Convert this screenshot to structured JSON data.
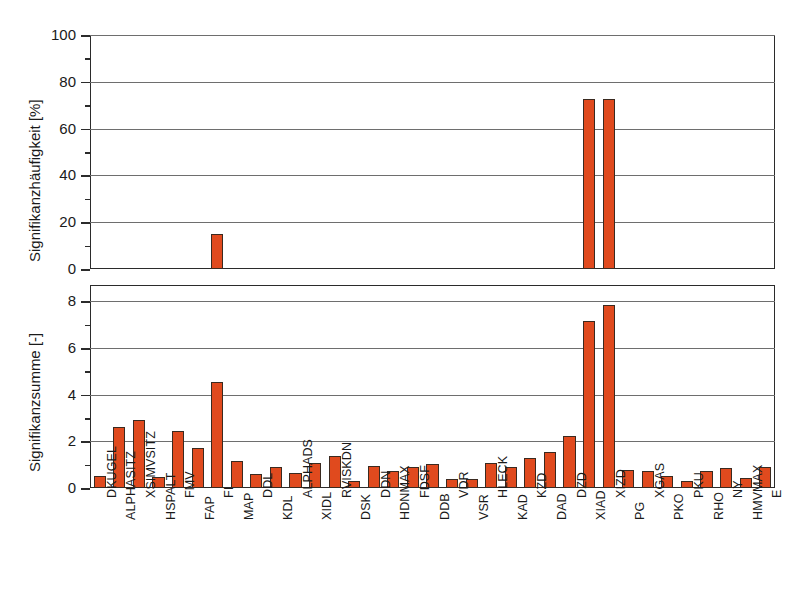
{
  "chart_data": {
    "type": "bar",
    "title": "",
    "xlabel": "",
    "grid": true,
    "legend": "none",
    "categories": [
      "DKUGEL",
      "ALPHASITZ",
      "XSIMVSITZ",
      "HSPALT",
      "FMV",
      "FAP",
      "FI",
      "MAP",
      "DDL",
      "KDL",
      "ALPHADS",
      "XIDL",
      "RVISKDN",
      "DSK",
      "DDN",
      "HDNMAX",
      "FDSF",
      "DDB",
      "VDR",
      "VSR",
      "HLECK",
      "KAD",
      "KZD",
      "DAD",
      "DZD",
      "XIAD",
      "XIZD",
      "PG",
      "XGAS",
      "PKO",
      "PKU",
      "RHO",
      "NY",
      "HMVMAX",
      "E"
    ],
    "panels": [
      {
        "id": "top",
        "ylabel": "Signifikanzhäufigkeit [%]",
        "ylim": [
          0,
          100
        ],
        "yticks": [
          0,
          20,
          40,
          60,
          80,
          100
        ],
        "ytick_labels": [
          "0",
          "20",
          "40",
          "60",
          "80",
          "100"
        ],
        "yminor_step": 10,
        "values": [
          0,
          0,
          0,
          0,
          0,
          0,
          15,
          0,
          0,
          0,
          0,
          0,
          0,
          0,
          0,
          0,
          0,
          0,
          0,
          0,
          0,
          0,
          0,
          0,
          0,
          72.5,
          72.5,
          0,
          0,
          0,
          0,
          0,
          0,
          0,
          0
        ]
      },
      {
        "id": "bottom",
        "ylabel": "Signifikanzsumme [-]",
        "ylim": [
          0,
          8.7
        ],
        "yticks": [
          0,
          2,
          4,
          6,
          8
        ],
        "ytick_labels": [
          "0",
          "2",
          "4",
          "6",
          "8"
        ],
        "yminor_step": 1,
        "values": [
          0.52,
          2.62,
          2.92,
          0.46,
          2.44,
          1.7,
          4.55,
          1.17,
          0.62,
          0.9,
          0.66,
          1.08,
          1.36,
          0.3,
          0.95,
          0.72,
          0.9,
          1.02,
          0.38,
          0.38,
          1.08,
          0.92,
          1.3,
          1.56,
          2.25,
          7.15,
          7.85,
          0.76,
          0.74,
          0.52,
          0.32,
          0.74,
          0.84,
          0.45,
          0.9
        ]
      }
    ]
  },
  "style": {
    "bar_color": "#e04a1e",
    "bar_edge_color": "#3a2a20",
    "grid_color": "#6e6e6e",
    "axis_color": "#2b2b2b",
    "background": "#ffffff"
  }
}
